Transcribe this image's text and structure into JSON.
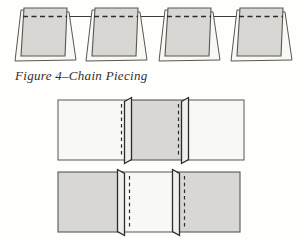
{
  "figure": {
    "caption": "Figure 4–Chain Piecing"
  },
  "colors": {
    "background": "#fefefd",
    "fabric_dark": "#d8d7d3",
    "fabric_light": "#f8f8f5",
    "flap_fill": "#efefec",
    "outline": "#5a5751",
    "stitch": "#2e2c28",
    "thread": "#3c3a35",
    "caption_text": "#322f2a"
  },
  "diagram": {
    "chain_row": {
      "unit_count": 4,
      "unit_style": "two offset fabric squares, dark square on top",
      "stitch_style": "dashed line near top edge of each square",
      "thread": "continuous solid thread connecting all units"
    },
    "pieced_rows": [
      {
        "squares": [
          "light",
          "dark",
          "light"
        ],
        "seam_count": 2,
        "seam_allowance": "pressed toward dark center, dashed stitch left of each flap"
      },
      {
        "squares": [
          "dark",
          "light",
          "dark"
        ],
        "seam_count": 2,
        "seam_allowance": "pressed toward dark outer squares, dashed stitch right of each flap"
      }
    ]
  }
}
